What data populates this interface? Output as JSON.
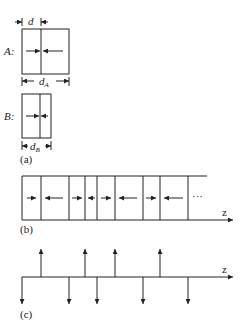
{
  "panel_a": {
    "label": "(a)",
    "box_a": {
      "name": "A:",
      "dim_label": "d",
      "dim_sub": "A",
      "thin_dim_label": "d"
    },
    "box_b": {
      "name": "B:",
      "dim_label": "d",
      "dim_sub": "B"
    }
  },
  "panel_b": {
    "label": "(b)",
    "axis_label": "z",
    "ellipsis": "···",
    "boundaries_x": [
      22,
      41,
      69,
      85,
      97,
      115,
      143,
      160,
      188
    ],
    "arrow_directions": [
      "right",
      "left",
      "right",
      "left",
      "right",
      "left",
      "right",
      "left"
    ]
  },
  "panel_c": {
    "label": "(c)",
    "axis_label": "z",
    "spikes": [
      {
        "x": 22,
        "dir": "down"
      },
      {
        "x": 41,
        "dir": "up"
      },
      {
        "x": 69,
        "dir": "down"
      },
      {
        "x": 85,
        "dir": "up"
      },
      {
        "x": 97,
        "dir": "down"
      },
      {
        "x": 115,
        "dir": "up"
      },
      {
        "x": 143,
        "dir": "down"
      },
      {
        "x": 160,
        "dir": "up"
      },
      {
        "x": 188,
        "dir": "down"
      }
    ]
  }
}
